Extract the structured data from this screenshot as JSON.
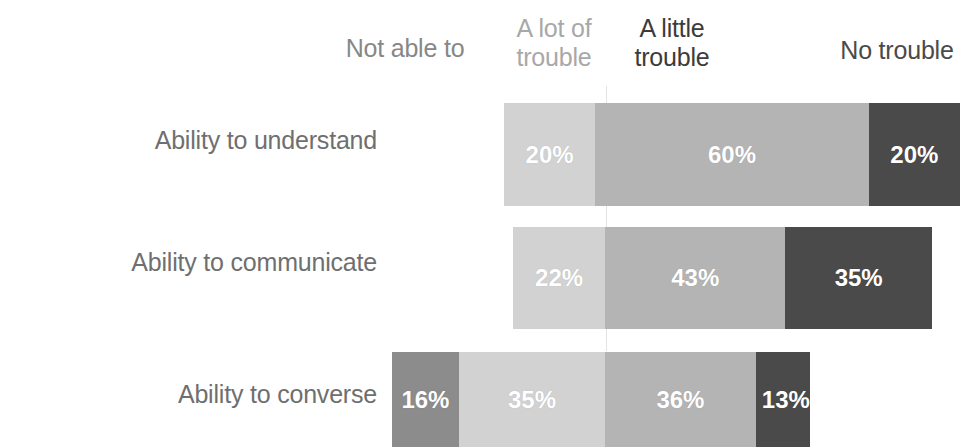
{
  "chart_data": {
    "type": "bar",
    "subtype": "stacked-horizontal-100pct",
    "title": "",
    "subtitle": "",
    "xlabel": "",
    "ylabel": "",
    "grid": false,
    "legend_position": "top",
    "axis_ranges": {
      "x": [
        0,
        100
      ],
      "x_unit": "%"
    },
    "categories": [
      "Ability to understand",
      "Ability to communicate",
      "Ability to converse"
    ],
    "series": [
      {
        "name": "Not able to",
        "color": "#8c8c8c",
        "values": [
          0,
          0,
          16
        ]
      },
      {
        "name": "A lot of trouble",
        "color": "#d2d2d2",
        "values": [
          20,
          22,
          35
        ]
      },
      {
        "name": "A little trouble",
        "color": "#b4b4b4",
        "values": [
          60,
          43,
          36
        ]
      },
      {
        "name": "No trouble",
        "color": "#4a4a4a",
        "values": [
          20,
          35,
          13
        ]
      }
    ],
    "value_labels": [
      [
        "20%",
        "60%",
        "20%"
      ],
      [
        "22%",
        "43%",
        "35%"
      ],
      [
        "16%",
        "35%",
        "36%",
        "13%"
      ]
    ]
  },
  "legend": {
    "not_able_to": "Not able to",
    "a_lot_of_trouble": "A lot of\ntrouble",
    "a_little_trouble": "A little\ntrouble",
    "no_trouble": "No trouble"
  },
  "rows": [
    {
      "label": "Ability to understand",
      "segments": [
        {
          "series": "A lot of trouble",
          "value": "20%",
          "pct": 20,
          "color": "#d2d2d2"
        },
        {
          "series": "A little trouble",
          "value": "60%",
          "pct": 60,
          "color": "#b4b4b4"
        },
        {
          "series": "No trouble",
          "value": "20%",
          "pct": 20,
          "color": "#4a4a4a"
        }
      ]
    },
    {
      "label": "Ability to communicate",
      "segments": [
        {
          "series": "A lot of trouble",
          "value": "22%",
          "pct": 22,
          "color": "#d2d2d2"
        },
        {
          "series": "A little trouble",
          "value": "43%",
          "pct": 43,
          "color": "#b4b4b4"
        },
        {
          "series": "No trouble",
          "value": "35%",
          "pct": 35,
          "color": "#4a4a4a"
        }
      ]
    },
    {
      "label": "Ability to converse",
      "segments": [
        {
          "series": "Not able to",
          "value": "16%",
          "pct": 16,
          "color": "#8c8c8c"
        },
        {
          "series": "A lot of trouble",
          "value": "35%",
          "pct": 35,
          "color": "#d2d2d2"
        },
        {
          "series": "A little trouble",
          "value": "36%",
          "pct": 36,
          "color": "#b4b4b4"
        },
        {
          "series": "No trouble",
          "value": "13%",
          "pct": 13,
          "color": "#4a4a4a"
        }
      ]
    }
  ],
  "colors": {
    "not_able_to": "#8c8c8c",
    "a_lot_of_trouble": "#d2d2d2",
    "a_little_trouble": "#b4b4b4",
    "no_trouble": "#4a4a4a",
    "row_label_text": "#6f6f6f",
    "value_label_text": "#ffffff",
    "reference_line": "#e3e3e3",
    "background": "#ffffff"
  }
}
